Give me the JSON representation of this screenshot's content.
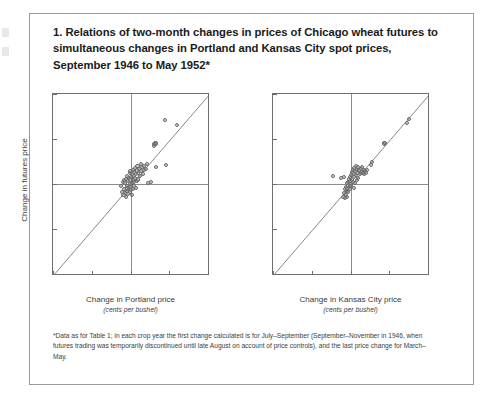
{
  "figure": {
    "title": "1. Relations of two-month changes in prices of Chicago wheat futures to simultaneous changes in Portland and Kansas City spot prices, September 1946 to May 1952*",
    "footnote": "*Data as for Table 1; in each crop year the first change calculated is for July–September (September–November in 1946, when futures trading was temporarily discontinued until late August on account of price controls), and the last price change for March–May."
  },
  "chart_data": [
    {
      "type": "scatter",
      "title": "Change in futures price vs Change in Portland price",
      "xlabel": "Change in Portland price",
      "xlabel_sub": "(cents per bushel)",
      "ylabel": "Change in futures price",
      "xlim": [
        -100,
        100
      ],
      "ylim": [
        -100,
        100
      ],
      "xticks": [
        -100,
        -50,
        0,
        50,
        100
      ],
      "xticklabels": [
        "–100",
        "–50",
        "0",
        "+50",
        "+100"
      ],
      "yticks": [
        -100,
        -50,
        0,
        50,
        100
      ],
      "yticklabels": [
        "–100",
        "–50",
        "0",
        "+50",
        "+100"
      ],
      "grid": false,
      "reference_line": {
        "type": "identity",
        "from": [
          -100,
          -100
        ],
        "to": [
          100,
          100
        ]
      },
      "points": [
        [
          -82,
          -123
        ],
        [
          -53,
          -133
        ],
        [
          -12,
          -2
        ],
        [
          -11,
          -9
        ],
        [
          -10,
          2
        ],
        [
          -9,
          -12
        ],
        [
          -8,
          -6
        ],
        [
          -8,
          4
        ],
        [
          -7,
          -10
        ],
        [
          -7,
          1
        ],
        [
          -6,
          -14
        ],
        [
          -6,
          6
        ],
        [
          -5,
          -8
        ],
        [
          -5,
          -2
        ],
        [
          -4,
          9
        ],
        [
          -4,
          -5
        ],
        [
          -3,
          3
        ],
        [
          -3,
          -11
        ],
        [
          -2,
          7
        ],
        [
          -2,
          -4
        ],
        [
          -1,
          12
        ],
        [
          -1,
          0
        ],
        [
          -1,
          -9
        ],
        [
          0,
          5
        ],
        [
          0,
          -3
        ],
        [
          0,
          14
        ],
        [
          1,
          8
        ],
        [
          1,
          -7
        ],
        [
          2,
          11
        ],
        [
          2,
          1
        ],
        [
          2,
          -12
        ],
        [
          3,
          16
        ],
        [
          3,
          4
        ],
        [
          3,
          -6
        ],
        [
          4,
          9
        ],
        [
          4,
          -2
        ],
        [
          5,
          13
        ],
        [
          5,
          2
        ],
        [
          6,
          18
        ],
        [
          6,
          7
        ],
        [
          7,
          11
        ],
        [
          7,
          -4
        ],
        [
          8,
          15
        ],
        [
          8,
          3
        ],
        [
          9,
          20
        ],
        [
          10,
          12
        ],
        [
          10,
          5
        ],
        [
          11,
          17
        ],
        [
          12,
          9
        ],
        [
          13,
          22
        ],
        [
          14,
          14
        ],
        [
          15,
          19
        ],
        [
          16,
          11
        ],
        [
          17,
          16
        ],
        [
          18,
          20
        ],
        [
          20,
          17
        ],
        [
          21,
          22
        ],
        [
          23,
          1
        ],
        [
          26,
          2
        ],
        [
          30,
          42
        ],
        [
          31,
          44
        ],
        [
          32,
          46
        ],
        [
          33,
          45
        ],
        [
          33,
          19
        ],
        [
          44,
          71
        ],
        [
          46,
          21
        ],
        [
          60,
          66
        ]
      ]
    },
    {
      "type": "scatter",
      "title": "Change in futures price vs Change in Kansas City price",
      "xlabel": "Change in Kansas City price",
      "xlabel_sub": "(cents per bushel)",
      "ylabel": "Change in futures price",
      "xlim": [
        -100,
        100
      ],
      "ylim": [
        -100,
        100
      ],
      "xticks": [
        -100,
        -50,
        0,
        50,
        100
      ],
      "xticklabels": [
        "–100",
        "–50",
        "0",
        "+50",
        "+100"
      ],
      "yticks": [
        -100,
        -50,
        0,
        50,
        100
      ],
      "yticklabels": [
        "–100",
        "–50",
        "0",
        "+50",
        "+100"
      ],
      "grid": false,
      "reference_line": {
        "type": "identity",
        "from": [
          -100,
          -100
        ],
        "to": [
          100,
          100
        ]
      },
      "points": [
        [
          -80,
          -123
        ],
        [
          -61,
          -133
        ],
        [
          -22,
          9
        ],
        [
          -12,
          7
        ],
        [
          -8,
          8
        ],
        [
          -9,
          -14
        ],
        [
          -8,
          -10
        ],
        [
          -7,
          -6
        ],
        [
          -7,
          -16
        ],
        [
          -6,
          -3
        ],
        [
          -6,
          -12
        ],
        [
          -5,
          -8
        ],
        [
          -5,
          1
        ],
        [
          -4,
          -5
        ],
        [
          -4,
          -14
        ],
        [
          -3,
          2
        ],
        [
          -3,
          -9
        ],
        [
          -2,
          5
        ],
        [
          -2,
          -3
        ],
        [
          -1,
          8
        ],
        [
          -1,
          -6
        ],
        [
          0,
          3
        ],
        [
          0,
          -2
        ],
        [
          1,
          10
        ],
        [
          1,
          0
        ],
        [
          2,
          13
        ],
        [
          2,
          5
        ],
        [
          3,
          16
        ],
        [
          3,
          2
        ],
        [
          4,
          11
        ],
        [
          4,
          -4
        ],
        [
          5,
          18
        ],
        [
          5,
          8
        ],
        [
          6,
          14
        ],
        [
          6,
          1
        ],
        [
          7,
          20
        ],
        [
          7,
          10
        ],
        [
          8,
          16
        ],
        [
          8,
          4
        ],
        [
          9,
          12
        ],
        [
          10,
          19
        ],
        [
          10,
          7
        ],
        [
          11,
          15
        ],
        [
          12,
          11
        ],
        [
          13,
          17
        ],
        [
          14,
          13
        ],
        [
          15,
          19
        ],
        [
          16,
          12
        ],
        [
          17,
          16
        ],
        [
          18,
          11
        ],
        [
          19,
          14
        ],
        [
          20,
          12
        ],
        [
          21,
          16
        ],
        [
          26,
          21
        ],
        [
          28,
          24
        ],
        [
          43,
          45
        ],
        [
          44,
          46
        ],
        [
          73,
          68
        ],
        [
          76,
          72
        ]
      ]
    }
  ]
}
